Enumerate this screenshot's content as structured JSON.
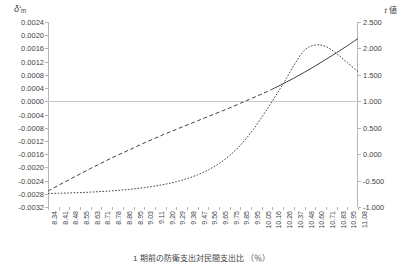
{
  "chart_data": {
    "type": "line",
    "title": "",
    "xlabel": "1 期前の防衛支出対民間支出比 （％）",
    "ylabel_left": "δ'm",
    "ylabel_right": "t 値",
    "grid": false,
    "legend": "none",
    "ylim_left": [
      -0.0032,
      0.0024
    ],
    "ylim_right": [
      -1.0,
      2.5
    ],
    "y_ticks_left": [
      "0.0024",
      "0.0020",
      "0.0016",
      "0.0012",
      "0.0008",
      "0.0004",
      "0.0000",
      "-0.0004",
      "-0.0008",
      "-0.0012",
      "-0.0016",
      "-0.0020",
      "-0.0024",
      "-0.0028",
      "-0.0032"
    ],
    "y_ticks_left_values": [
      0.0024,
      0.002,
      0.0016,
      0.0012,
      0.0008,
      0.0004,
      0.0,
      -0.0004,
      -0.0008,
      -0.0012,
      -0.0016,
      -0.002,
      -0.0024,
      -0.0028,
      -0.0032
    ],
    "y_ticks_right": [
      "2.500",
      "2.000",
      "1.500",
      "1.000",
      "0.500",
      "0.000",
      "-0.500",
      "-1.000"
    ],
    "y_ticks_right_values": [
      2.5,
      2.0,
      1.5,
      1.0,
      0.5,
      0.0,
      -0.5,
      -1.0
    ],
    "categories": [
      "8.34",
      "8.41",
      "8.48",
      "8.55",
      "8.63",
      "8.71",
      "8.78",
      "8.86",
      "8.95",
      "9.03",
      "9.11",
      "9.20",
      "9.29",
      "9.38",
      "9.47",
      "9.56",
      "9.65",
      "9.75",
      "9.85",
      "9.95",
      "10.05",
      "10.16",
      "10.26",
      "10.37",
      "10.48",
      "10.60",
      "10.71",
      "10.83",
      "10.95",
      "11.08"
    ],
    "series": [
      {
        "name": "delta-m",
        "axis": "left",
        "style": "dashed-then-solid",
        "solid_from_index": 21,
        "values": [
          -0.00272,
          -0.00254,
          -0.00237,
          -0.0022,
          -0.00203,
          -0.00187,
          -0.00171,
          -0.00156,
          -0.00141,
          -0.00126,
          -0.00112,
          -0.00098,
          -0.00085,
          -0.00072,
          -0.00059,
          -0.00046,
          -0.00033,
          -0.0002,
          -6e-05,
          8e-05,
          0.00022,
          0.00037,
          0.00053,
          0.0007,
          0.00088,
          0.00107,
          0.00127,
          0.00147,
          0.00168,
          0.0019
        ]
      },
      {
        "name": "t-value",
        "axis": "right",
        "style": "dotted",
        "values": [
          -0.745,
          -0.74,
          -0.734,
          -0.727,
          -0.718,
          -0.707,
          -0.694,
          -0.678,
          -0.658,
          -0.634,
          -0.604,
          -0.567,
          -0.521,
          -0.463,
          -0.39,
          -0.297,
          -0.178,
          -0.025,
          0.17,
          0.412,
          0.7,
          1.01,
          1.33,
          1.68,
          1.965,
          2.065,
          2.035,
          1.9,
          1.73,
          1.56
        ]
      }
    ]
  },
  "axis_labels": {
    "left_symbol": "δ'",
    "left_subscript": "m",
    "right_italic": "t",
    "right_rest": " 値"
  },
  "colors": {
    "axis": "#b5b5b5",
    "zero_line": "#c8c8c8",
    "series_line": "#404040",
    "text": "#3f3f3f",
    "background": "#ffffff"
  }
}
